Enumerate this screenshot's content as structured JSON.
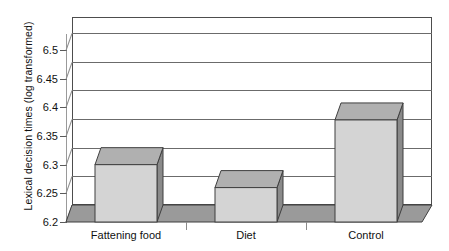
{
  "chart_data": {
    "type": "bar",
    "title": "",
    "subtitle": "",
    "xlabel": "",
    "ylabel": "Lexical decision times (log transformed)",
    "categories": [
      "Fattening food",
      "Diet",
      "Control"
    ],
    "values": [
      6.3,
      6.26,
      6.378
    ],
    "ylim": [
      6.2,
      6.5
    ],
    "yticks": [
      "6.2",
      "6.25",
      "6.3",
      "6.35",
      "6.4",
      "6.45",
      "6.5"
    ],
    "ytick_values": [
      6.2,
      6.25,
      6.3,
      6.35,
      6.4,
      6.45,
      6.5
    ],
    "grid": true,
    "legend": "none",
    "style": "3d-column",
    "colors": {
      "bar_front": "#d4d4d4",
      "bar_top": "#b0b0b0",
      "bar_side": "#8a8a8a",
      "floor": "#9a9a9a",
      "axis": "#4d4d4d",
      "grid": "#6b6b6b",
      "text": "#111111",
      "background": "#ffffff"
    }
  },
  "axis": {
    "y_title": "Lexical decision times (log transformed)",
    "y_ticks": [
      {
        "label": "6.5"
      },
      {
        "label": "6.45"
      },
      {
        "label": "6.4"
      },
      {
        "label": "6.35"
      },
      {
        "label": "6.3"
      },
      {
        "label": "6.25"
      },
      {
        "label": "6.2"
      }
    ],
    "x_ticks": [
      {
        "label": "Fattening food"
      },
      {
        "label": "Diet"
      },
      {
        "label": "Control"
      }
    ]
  }
}
